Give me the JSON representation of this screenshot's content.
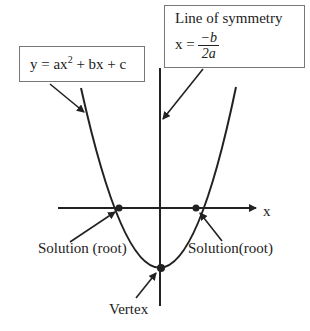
{
  "equation_box": {
    "text_prefix": "y = ax",
    "exponent": "2",
    "text_suffix": " + bx + c"
  },
  "symmetry_box": {
    "title": "Line of symmetry",
    "lhs": "x = ",
    "numerator": "−b",
    "denominator": "2a"
  },
  "labels": {
    "axis_x": "x",
    "root_left": "Solution (root)",
    "root_right": "Solution(root)",
    "vertex": "Vertex"
  },
  "colors": {
    "line": "#222222",
    "box_border": "#777777"
  }
}
